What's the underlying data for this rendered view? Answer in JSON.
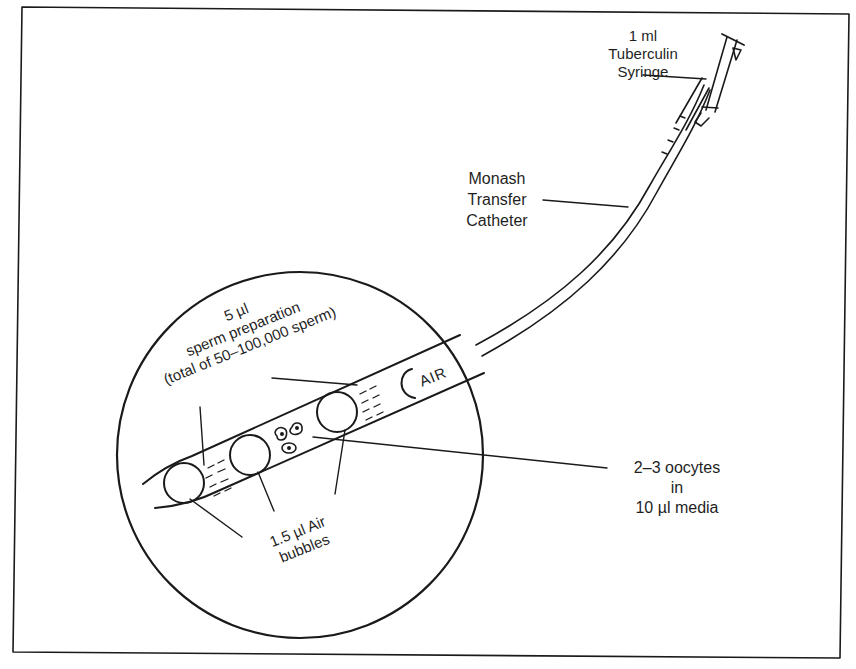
{
  "figure": {
    "labels": {
      "syringe": [
        "1 ml",
        "Tuberculin",
        "Syringe"
      ],
      "catheter": [
        "Monash",
        "Transfer",
        "Catheter"
      ],
      "sperm_prep": [
        "5 µl",
        "sperm preparation",
        "(total of 50–100,000 sperm)"
      ],
      "air_bubbles": [
        "1.5 µl Air",
        "bubbles"
      ],
      "oocytes": [
        "2–3 oocytes",
        "in",
        "10 µl media"
      ],
      "air_segment": "AIR"
    },
    "components": [
      {
        "id": "syringe",
        "name": "1 ml Tuberculin Syringe"
      },
      {
        "id": "catheter",
        "name": "Monash Transfer Catheter"
      },
      {
        "id": "magnified-view",
        "name": "Magnified catheter tip (circle inset)"
      }
    ],
    "catheter_loading_sequence_tip_to_syringe": [
      "1.5 µl Air bubble",
      "5 µl sperm preparation",
      "1.5 µl Air bubble",
      "2–3 oocytes in 10 µl media",
      "1.5 µl Air bubble",
      "5 µl sperm preparation",
      "AIR"
    ],
    "colors": {
      "ink": "#1a1a1a",
      "background": "#ffffff"
    }
  }
}
